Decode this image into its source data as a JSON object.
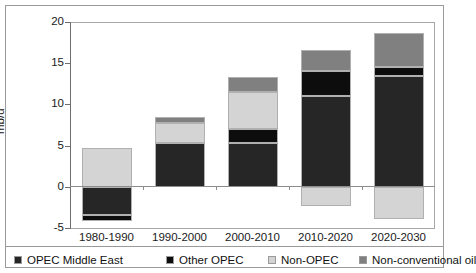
{
  "chart_data": {
    "type": "bar",
    "stacked": true,
    "title": "",
    "subtitle": "",
    "xlabel": "",
    "ylabel": "mb/d",
    "ylim": [
      -5,
      20
    ],
    "yticks": [
      20,
      15,
      10,
      5,
      0,
      -5
    ],
    "ytick_labels": [
      "20",
      "15",
      "10",
      "5",
      "0",
      "-5"
    ],
    "grid": false,
    "legend_position": "bottom",
    "categories": [
      "1980-1990",
      "1990-2000",
      "2000-2010",
      "2010-2020",
      "2020-2030"
    ],
    "series": [
      {
        "name": "OPEC Middle East",
        "color": "#262626",
        "values": [
          -3.4,
          5.3,
          5.3,
          11.0,
          13.4
        ]
      },
      {
        "name": "Other OPEC",
        "color": "#0d0d0d",
        "values": [
          -0.8,
          0.0,
          1.7,
          3.1,
          1.1
        ]
      },
      {
        "name": "Non-OPEC",
        "color": "#d4d4d4",
        "values": [
          4.7,
          2.4,
          4.5,
          -2.3,
          -3.9
        ]
      },
      {
        "name": "Non-conventional oil",
        "color": "#808080",
        "values": [
          0.0,
          0.8,
          1.8,
          2.5,
          4.2
        ]
      }
    ],
    "bar_totals_positive": [
      4.7,
      8.5,
      13.3,
      16.6,
      18.7
    ],
    "bar_totals_negative": [
      -4.2,
      0.0,
      0.0,
      -2.3,
      -3.9
    ]
  },
  "legend": {
    "items": [
      {
        "label": "OPEC Middle East",
        "color": "#262626"
      },
      {
        "label": "Other OPEC",
        "color": "#0d0d0d"
      },
      {
        "label": "Non-OPEC",
        "color": "#d4d4d4"
      },
      {
        "label": "Non-conventional oil",
        "color": "#808080"
      }
    ]
  },
  "axis": {
    "y_title": "mb/d",
    "y_labels": [
      "20",
      "15",
      "10",
      "5",
      "0",
      "-5"
    ],
    "x_labels": [
      "1980-1990",
      "1990-2000",
      "2000-2010",
      "2010-2020",
      "2020-2030"
    ]
  }
}
